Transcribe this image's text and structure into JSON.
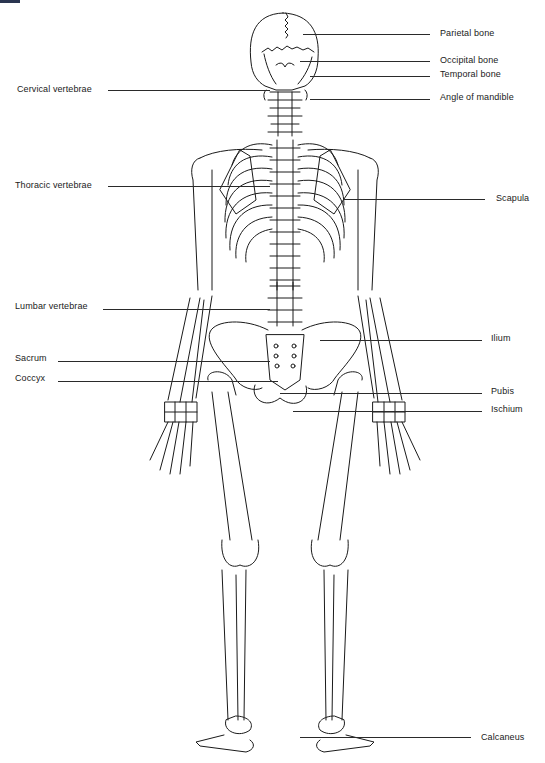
{
  "figure": {
    "labels_left": [
      {
        "text": "Cervical vertebrae",
        "x": 17,
        "y": 85,
        "line_x1": 108,
        "line_x2": 270,
        "line_y": 89
      },
      {
        "text": "Thoracic vertebrae",
        "x": 15,
        "y": 181,
        "line_x1": 108,
        "line_x2": 270,
        "line_y": 186
      },
      {
        "text": "Lumbar vertebrae",
        "x": 15,
        "y": 302,
        "line_x1": 103,
        "line_x2": 270,
        "line_y": 310
      },
      {
        "text": "Sacrum",
        "x": 15,
        "y": 354,
        "line_x1": 58,
        "line_x2": 270,
        "line_y": 361
      },
      {
        "text": "Coccyx",
        "x": 15,
        "y": 374,
        "line_x1": 58,
        "line_x2": 278,
        "line_y": 381
      }
    ],
    "labels_right": [
      {
        "text": "Parietal bone",
        "x": 440,
        "y": 29,
        "line_x1": 303,
        "line_x2": 430,
        "line_y": 34
      },
      {
        "text": "Occipital bone",
        "x": 440,
        "y": 56,
        "line_x1": 300,
        "line_x2": 430,
        "line_y": 61
      },
      {
        "text": "Temporal bone",
        "x": 440,
        "y": 70,
        "line_x1": 310,
        "line_x2": 430,
        "line_y": 75
      },
      {
        "text": "Angle of mandible",
        "x": 440,
        "y": 93,
        "line_x1": 310,
        "line_x2": 430,
        "line_y": 99
      },
      {
        "text": "Scapula",
        "x": 496,
        "y": 194,
        "line_x1": 343,
        "line_x2": 485,
        "line_y": 199
      },
      {
        "text": "Ilium",
        "x": 491,
        "y": 334,
        "line_x1": 320,
        "line_x2": 482,
        "line_y": 340
      },
      {
        "text": "Pubis",
        "x": 491,
        "y": 387,
        "line_x1": 280,
        "line_x2": 482,
        "line_y": 393
      },
      {
        "text": "Ischium",
        "x": 491,
        "y": 405,
        "line_x1": 293,
        "line_x2": 482,
        "line_y": 411
      },
      {
        "text": "Calcaneus",
        "x": 481,
        "y": 733,
        "line_x1": 300,
        "line_x2": 471,
        "line_y": 737
      }
    ]
  }
}
